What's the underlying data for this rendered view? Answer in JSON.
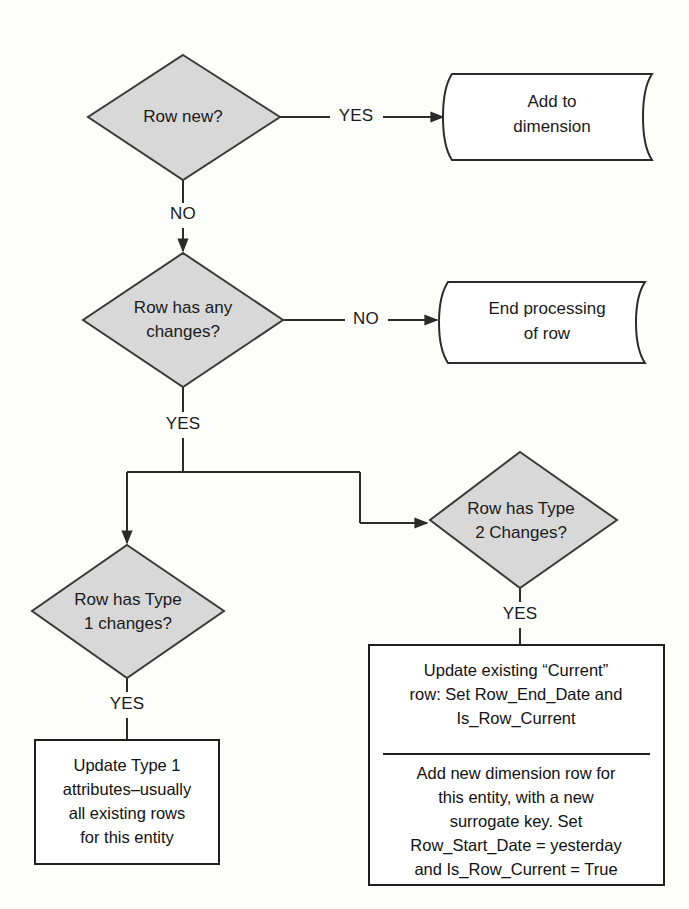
{
  "diagram": {
    "type": "flowchart",
    "colors": {
      "decision_fill": "#d8d8d8",
      "decision_stroke": "#3a3a3a",
      "process_fill": "#ffffff",
      "process_stroke": "#1f1f1f",
      "connector": "#2b2b2b",
      "text": "#1a1a1a",
      "background": "#fdfdfc"
    },
    "nodes": {
      "row_new": {
        "shape": "decision",
        "line1": "Row new?"
      },
      "add_to_dimension": {
        "shape": "tape",
        "line1": "Add to",
        "line2": "dimension"
      },
      "row_has_any_changes": {
        "shape": "decision",
        "line1": "Row has any",
        "line2": "changes?"
      },
      "end_processing": {
        "shape": "tape",
        "line1": "End processing",
        "line2": "of row"
      },
      "row_has_type2": {
        "shape": "decision",
        "line1": "Row has Type",
        "line2": "2 Changes?"
      },
      "row_has_type1": {
        "shape": "decision",
        "line1": "Row has Type",
        "line2": "1 changes?"
      },
      "update_type1": {
        "shape": "process",
        "line1": "Update Type 1",
        "line2": "attributes–usually",
        "line3": "all existing rows",
        "line4": "for this entity"
      },
      "type2_action": {
        "shape": "process-split",
        "upper": {
          "line1": "Update existing “Current”",
          "line2": "row: Set Row_End_Date and",
          "line3": "Is_Row_Current"
        },
        "lower": {
          "line1": "Add new dimension row for",
          "line2": "this entity, with a new",
          "line3": "surrogate key. Set",
          "line4": "Row_Start_Date = yesterday",
          "line5": "and Is_Row_Current = True"
        }
      }
    },
    "edges": {
      "row_new_yes": "YES",
      "row_new_no": "NO",
      "any_changes_no": "NO",
      "any_changes_yes": "YES",
      "type1_yes": "YES",
      "type2_yes": "YES"
    }
  }
}
